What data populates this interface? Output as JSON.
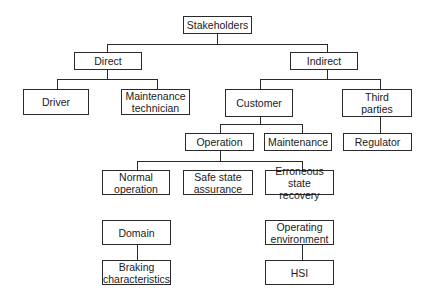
{
  "diagram": {
    "type": "hierarchy-tree",
    "nodes": {
      "stakeholders": "Stakeholders",
      "direct": "Direct",
      "indirect": "Indirect",
      "driver": "Driver",
      "maintenance_technician": "Maintenance\ntechnician",
      "customer": "Customer",
      "third_parties": "Third\nparties",
      "operation": "Operation",
      "maintenance": "Maintenance",
      "regulator": "Regulator",
      "normal_operation": "Normal\noperation",
      "safe_state_assurance": "Safe state\nassurance",
      "erroneous_state_recovery": "Erroneous\nstate recovery",
      "domain": "Domain",
      "braking_characteristics": "Braking\ncharacteristics",
      "operating_environment": "Operating\nenvironment",
      "hsi": "HSI"
    },
    "edges": [
      [
        "Stakeholders",
        "Direct"
      ],
      [
        "Stakeholders",
        "Indirect"
      ],
      [
        "Direct",
        "Driver"
      ],
      [
        "Direct",
        "Maintenance technician"
      ],
      [
        "Indirect",
        "Customer"
      ],
      [
        "Indirect",
        "Third parties"
      ],
      [
        "Customer",
        "Operation"
      ],
      [
        "Customer",
        "Maintenance"
      ],
      [
        "Third parties",
        "Regulator"
      ],
      [
        "Operation",
        "Normal operation"
      ],
      [
        "Operation",
        "Safe state assurance"
      ],
      [
        "Operation",
        "Erroneous state recovery"
      ],
      [
        "Domain",
        "Braking characteristics"
      ],
      [
        "Operating environment",
        "HSI"
      ]
    ],
    "colors": {
      "line": "#2a2a2a",
      "box_fill": "#ffffff",
      "text": "#1a1a1a"
    }
  }
}
